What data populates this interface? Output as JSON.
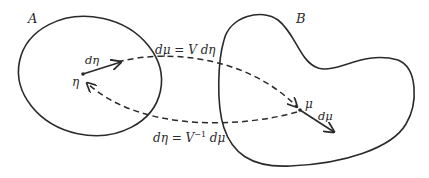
{
  "diagram": {
    "regions": {
      "A": {
        "label": "A"
      },
      "B": {
        "label": "B"
      }
    },
    "points": {
      "eta": {
        "label": "η"
      },
      "mu": {
        "label": "μ"
      }
    },
    "vectors": {
      "d_eta": {
        "label": "dη"
      },
      "d_mu": {
        "label": "dμ"
      }
    },
    "mappings": {
      "forward": {
        "label": "dμ = V dη"
      },
      "inverse": {
        "label_main": "dη = V",
        "label_sup": "−1",
        "label_tail": " dμ"
      }
    },
    "colors": {
      "stroke": "#2a2a2a",
      "background": "#ffffff"
    }
  }
}
